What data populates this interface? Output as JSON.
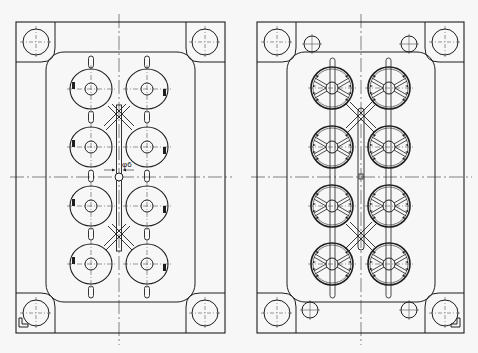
{
  "drawing": {
    "background": "#f7f7f7",
    "line_color": "#1e1e1e",
    "center_line_color": "#333333",
    "views": [
      {
        "id": "left",
        "name": "mold-plate-view-left",
        "cavity_style": "plain",
        "dimension_label": "φ6",
        "has_guide_pins": false
      },
      {
        "id": "right",
        "name": "mold-plate-view-right",
        "cavity_style": "ribbed",
        "dimension_label": "",
        "has_guide_pins": true
      }
    ],
    "cavity_count_per_view": 8,
    "corner_marker": "L"
  }
}
